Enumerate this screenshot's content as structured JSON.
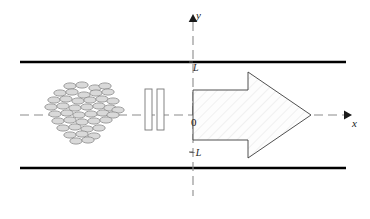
{
  "figure": {
    "labels": {
      "y_axis": "y",
      "x_axis": "x",
      "upper_wall": "L",
      "origin": "0",
      "lower_wall": "−L"
    },
    "colors": {
      "wall": "#000000",
      "axis_dash": "#8c8c8c",
      "particle_fill": "#d9d9d9",
      "particle_stroke": "#8a8a8a",
      "arrow_stroke": "#3c3c3c",
      "arrow_fill": "#fbfbfb",
      "plate_stroke": "#777777",
      "plate_fill": "#ffffff",
      "text": "#1a1a1a"
    },
    "geometry": {
      "canvas": [
        370,
        219
      ],
      "wall_x_start": 20,
      "wall_x_end": 346,
      "upper_wall_y": 62,
      "lower_wall_y": 168,
      "axis_x_y": 115,
      "axis_x_start": 20,
      "axis_x_end": 348,
      "axis_y_x": 193,
      "axis_y_top": 18,
      "axis_y_bottom": 196
    },
    "elements": {
      "particle_cluster_name": "particle-cluster",
      "grid_plate_count": 2,
      "arrow_direction": "right"
    },
    "particles": [
      [
        70,
        86
      ],
      [
        82,
        85
      ],
      [
        95,
        88
      ],
      [
        105,
        86
      ],
      [
        60,
        93
      ],
      [
        72,
        92
      ],
      [
        84,
        95
      ],
      [
        96,
        93
      ],
      [
        108,
        92
      ],
      [
        54,
        100
      ],
      [
        66,
        99
      ],
      [
        78,
        101
      ],
      [
        90,
        100
      ],
      [
        102,
        99
      ],
      [
        113,
        101
      ],
      [
        51,
        107
      ],
      [
        63,
        106
      ],
      [
        75,
        108
      ],
      [
        87,
        107
      ],
      [
        99,
        106
      ],
      [
        110,
        108
      ],
      [
        118,
        110
      ],
      [
        55,
        114
      ],
      [
        67,
        113
      ],
      [
        79,
        115
      ],
      [
        91,
        114
      ],
      [
        103,
        113
      ],
      [
        113,
        115
      ],
      [
        58,
        121
      ],
      [
        70,
        120
      ],
      [
        82,
        122
      ],
      [
        94,
        121
      ],
      [
        106,
        120
      ],
      [
        63,
        128
      ],
      [
        75,
        127
      ],
      [
        87,
        129
      ],
      [
        99,
        128
      ],
      [
        70,
        135
      ],
      [
        82,
        134
      ],
      [
        94,
        136
      ],
      [
        76,
        141
      ],
      [
        88,
        140
      ]
    ],
    "plates": [
      {
        "x": 145,
        "y": 89,
        "w": 7,
        "h": 41
      },
      {
        "x": 157,
        "y": 89,
        "w": 7,
        "h": 41
      }
    ],
    "arrow": {
      "tail_x": 193,
      "body_top": 90,
      "body_bottom": 140,
      "head_base_x": 248,
      "head_top": 72,
      "head_bottom": 158,
      "tip_x": 311,
      "tip_y": 115
    }
  }
}
